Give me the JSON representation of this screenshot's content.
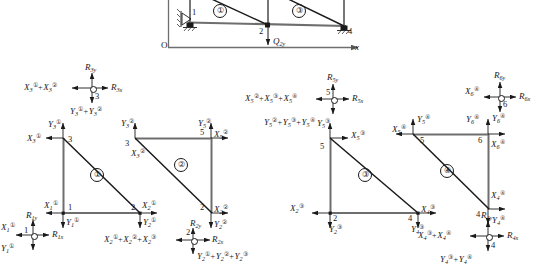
{
  "figure": {
    "kind": "truss-finite-element-free-body-diagram",
    "axis": {
      "origin_label": "O",
      "x_label": "x",
      "y_label": "y"
    },
    "global_structure": {
      "caption": "",
      "elements": [
        "①",
        "③"
      ],
      "node_numbers": [
        "1",
        "2",
        "4"
      ],
      "applied_load": "Q",
      "applied_load_sub": "2y",
      "supports": [
        "pin",
        "roller",
        "roller"
      ]
    },
    "element_labels": {
      "e1": "①",
      "e2": "②",
      "e3": "③",
      "e4": "④"
    },
    "nodes": {
      "n1": "1",
      "n2": "2",
      "n3": "3",
      "n4": "4",
      "n5": "5",
      "n6": "6"
    },
    "reactions": {
      "r1x": {
        "base": "R",
        "sub": "1x"
      },
      "r1y": {
        "base": "R",
        "sub": "1y"
      },
      "r2x": {
        "base": "R",
        "sub": "2x"
      },
      "r2y": {
        "base": "R",
        "sub": "2y"
      },
      "r3x": {
        "base": "R",
        "sub": "3x"
      },
      "r3y": {
        "base": "R",
        "sub": "3y"
      },
      "r4x": {
        "base": "R",
        "sub": "4x"
      },
      "r4y": {
        "base": "R",
        "sub": "4y"
      },
      "r5x": {
        "base": "R",
        "sub": "5x"
      },
      "r5y": {
        "base": "R",
        "sub": "5y"
      },
      "r6x": {
        "base": "R",
        "sub": "6x"
      },
      "r6y": {
        "base": "R",
        "sub": "6y"
      }
    },
    "node_equilibrium": [
      {
        "name": "node-3-equilibrium",
        "node": "3",
        "left_terms": [
          {
            "base": "X",
            "sub": "3",
            "sup": "①"
          },
          {
            "base": "X",
            "sub": "3",
            "sup": "②"
          }
        ],
        "down_terms": [
          {
            "base": "Y",
            "sub": "3",
            "sup": "①"
          },
          {
            "base": "Y",
            "sub": "3",
            "sup": "②"
          }
        ],
        "up_reaction": {
          "base": "R",
          "sub": "3y"
        },
        "right_reaction": {
          "base": "R",
          "sub": "3x"
        }
      },
      {
        "name": "node-1-equilibrium",
        "node": "1",
        "left_terms": [
          {
            "base": "X",
            "sub": "1",
            "sup": "①"
          }
        ],
        "down_terms": [
          {
            "base": "Y",
            "sub": "1",
            "sup": "①"
          }
        ],
        "up_reaction": {
          "base": "R",
          "sub": "1y"
        },
        "right_reaction": {
          "base": "R",
          "sub": "1x"
        }
      },
      {
        "name": "node-2-equilibrium",
        "node": "2",
        "left_terms": [
          {
            "base": "X",
            "sub": "2",
            "sup": "①"
          },
          {
            "base": "X",
            "sub": "2",
            "sup": "②"
          },
          {
            "base": "X",
            "sub": "2",
            "sup": "③"
          }
        ],
        "down_terms": [
          {
            "base": "Y",
            "sub": "2",
            "sup": "①"
          },
          {
            "base": "Y",
            "sub": "2",
            "sup": "②"
          },
          {
            "base": "Y",
            "sub": "2",
            "sup": "③"
          }
        ],
        "right_reaction": {
          "base": "R",
          "sub": "2x"
        }
      },
      {
        "name": "node-5-equilibrium",
        "node": "5",
        "left_terms": [
          {
            "base": "X",
            "sub": "5",
            "sup": "②"
          },
          {
            "base": "X",
            "sub": "5",
            "sup": "③"
          },
          {
            "base": "X",
            "sub": "5",
            "sup": "④"
          }
        ],
        "down_terms": [
          {
            "base": "Y",
            "sub": "5",
            "sup": "②"
          },
          {
            "base": "Y",
            "sub": "5",
            "sup": "③"
          },
          {
            "base": "Y",
            "sub": "5",
            "sup": "④"
          }
        ],
        "up_reaction": {
          "base": "R",
          "sub": "5y"
        },
        "right_reaction": {
          "base": "R",
          "sub": "5x"
        }
      },
      {
        "name": "node-6-equilibrium",
        "node": "6",
        "left_terms": [
          {
            "base": "X",
            "sub": "6",
            "sup": "④"
          }
        ],
        "down_terms": [
          {
            "base": "Y",
            "sub": "6",
            "sup": "④"
          }
        ],
        "up_reaction": {
          "base": "R",
          "sub": "6y"
        },
        "right_reaction": {
          "base": "R",
          "sub": "6x"
        }
      },
      {
        "name": "node-4-equilibrium",
        "node": "4",
        "left_terms": [
          {
            "base": "X",
            "sub": "4",
            "sup": "③"
          },
          {
            "base": "X",
            "sub": "4",
            "sup": "④"
          }
        ],
        "down_terms": [
          {
            "base": "Y",
            "sub": "4",
            "sup": "③"
          },
          {
            "base": "Y",
            "sub": "4",
            "sup": "④"
          }
        ],
        "up_reaction": {
          "base": "R",
          "sub": "4y"
        },
        "right_reaction": {
          "base": "R",
          "sub": "4x"
        }
      }
    ],
    "element_forces": {
      "e1": [
        {
          "name": "X3-e1",
          "base": "X",
          "sub": "3",
          "sup": "①"
        },
        {
          "name": "Y3-e1",
          "base": "Y",
          "sub": "3",
          "sup": "①"
        },
        {
          "name": "X1-e1",
          "base": "X",
          "sub": "1",
          "sup": "①"
        },
        {
          "name": "Y1-e1",
          "base": "Y",
          "sub": "1",
          "sup": "①"
        },
        {
          "name": "X2-e1",
          "base": "X",
          "sub": "2",
          "sup": "①"
        },
        {
          "name": "Y2-e1",
          "base": "Y",
          "sub": "2",
          "sup": "①"
        }
      ],
      "e2": [
        {
          "name": "Y3-e2",
          "base": "Y",
          "sub": "3",
          "sup": "②"
        },
        {
          "name": "X3-e2",
          "base": "X",
          "sub": "3",
          "sup": "②"
        },
        {
          "name": "Y5-e2",
          "base": "Y",
          "sub": "5",
          "sup": "②"
        },
        {
          "name": "X5-e2",
          "base": "X",
          "sub": "5",
          "sup": "②"
        },
        {
          "name": "X2-e2",
          "base": "X",
          "sub": "2",
          "sup": "②"
        },
        {
          "name": "Y2-e2",
          "base": "Y",
          "sub": "2",
          "sup": "②"
        }
      ],
      "e3": [
        {
          "name": "Y5-e3",
          "base": "Y",
          "sub": "5",
          "sup": "③"
        },
        {
          "name": "X5-e3",
          "base": "X",
          "sub": "5",
          "sup": "③"
        },
        {
          "name": "X2-e3",
          "base": "X",
          "sub": "2",
          "sup": "③"
        },
        {
          "name": "Y2-e3",
          "base": "Y",
          "sub": "2",
          "sup": "③"
        },
        {
          "name": "X4-e3",
          "base": "X",
          "sub": "4",
          "sup": "③"
        },
        {
          "name": "Y4-e3",
          "base": "Y",
          "sub": "4",
          "sup": "③"
        }
      ],
      "e4": [
        {
          "name": "X5-e4",
          "base": "X",
          "sub": "5",
          "sup": "④"
        },
        {
          "name": "Y5-e4",
          "base": "Y",
          "sub": "5",
          "sup": "④"
        },
        {
          "name": "Y6-e4",
          "base": "Y",
          "sub": "6",
          "sup": "④"
        },
        {
          "name": "X6-e4",
          "base": "X",
          "sub": "6",
          "sup": "④"
        },
        {
          "name": "X4-e4",
          "base": "X",
          "sub": "4",
          "sup": "④"
        },
        {
          "name": "Y4-e4",
          "base": "Y",
          "sub": "4",
          "sup": "④"
        }
      ]
    },
    "text": {
      "O": "O",
      "x": "x",
      "plus": "+",
      "Q2y_base": "Q",
      "Q2y_sub": "2y"
    },
    "colors": {
      "ink": "#1a1a1a",
      "member_gray": "#6e6e6e",
      "paper": "#ffffff"
    }
  }
}
